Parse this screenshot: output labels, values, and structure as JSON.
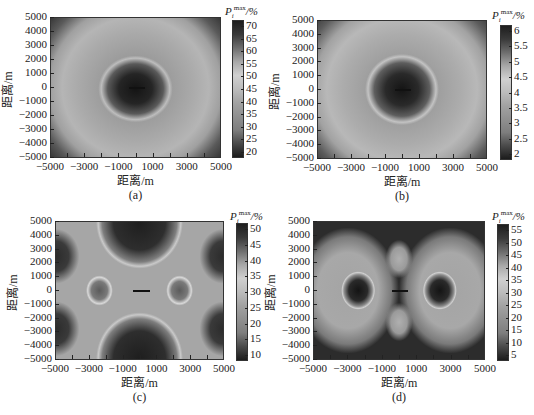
{
  "chart_data": [
    {
      "type": "heatmap",
      "panel": "(a)",
      "xlabel": "距离/m",
      "ylabel": "距离/m",
      "colorbar_title": "P_i^max/%",
      "xticks": [
        "−5000",
        "−3000",
        "−1000",
        "1000",
        "3000",
        "5000"
      ],
      "yticks": [
        "5000",
        "4000",
        "3000",
        "2000",
        "1000",
        "0",
        "−1000",
        "−2000",
        "−3000",
        "−4000",
        "−5000"
      ],
      "xlim": [
        -5000,
        5000
      ],
      "ylim": [
        -5000,
        5000
      ],
      "colorbar_ticks": [
        "70",
        "65",
        "60",
        "55",
        "50",
        "45",
        "40",
        "35",
        "30",
        "25",
        "20"
      ],
      "colorbar_range": [
        20,
        72
      ],
      "pattern": "dark central ellipse at origin (~20%), bright ring around it, mid-gray annulus to ~4500 m, dark corners",
      "grid": false
    },
    {
      "type": "heatmap",
      "panel": "(b)",
      "xlabel": "距离/m",
      "ylabel": "距离/m",
      "colorbar_title": "P_i^max/%",
      "xticks": [
        "−5000",
        "−3000",
        "−1000",
        "1000",
        "3000",
        "5000"
      ],
      "yticks": [
        "5000",
        "4000",
        "3000",
        "2000",
        "1000",
        "0",
        "−1000",
        "−2000",
        "−3000",
        "−4000",
        "−5000"
      ],
      "xlim": [
        -5000,
        5000
      ],
      "ylim": [
        -5000,
        5000
      ],
      "colorbar_ticks": [
        "6",
        "5.5",
        "5",
        "4.5",
        "4",
        "3.5",
        "3",
        "2.5",
        "2"
      ],
      "colorbar_range": [
        1.8,
        6.1
      ],
      "pattern": "dark central ellipse at origin, bright ring, mid-gray annulus, dark corners",
      "grid": false
    },
    {
      "type": "heatmap",
      "panel": "(c)",
      "xlabel": "距离/m",
      "ylabel": "距离/m",
      "colorbar_title": "P_i^max/%",
      "xticks": [
        "−5000",
        "−3000",
        "−1000",
        "1000",
        "3000",
        "5000"
      ],
      "yticks": [
        "5000",
        "4000",
        "3000",
        "2000",
        "1000",
        "0",
        "−1000",
        "−2000",
        "−3000",
        "−4000",
        "−5000"
      ],
      "xlim": [
        -5000,
        5000
      ],
      "ylim": [
        -5000,
        5000
      ],
      "colorbar_ticks": [
        "50",
        "45",
        "40",
        "35",
        "30",
        "25",
        "20",
        "15",
        "10"
      ],
      "colorbar_range": [
        9,
        54
      ],
      "pattern": "X-shaped bright band; dark lobes at top/bottom centre and at four side edges; two small dark circles at (±2500, 0); source arrow at origin",
      "grid": false
    },
    {
      "type": "heatmap",
      "panel": "(d)",
      "xlabel": "距离/m",
      "ylabel": "距离/m",
      "colorbar_title": "P_i^max/%",
      "xticks": [
        "−5000",
        "−3000",
        "−1000",
        "1000",
        "3000",
        "5000"
      ],
      "yticks": [
        "5000",
        "4000",
        "3000",
        "2000",
        "1000",
        "0",
        "−1000",
        "−2000",
        "−3000",
        "−4000",
        "−5000"
      ],
      "xlim": [
        -5000,
        5000
      ],
      "ylim": [
        -5000,
        5000
      ],
      "colorbar_ticks": [
        "55",
        "50",
        "45",
        "40",
        "35",
        "30",
        "25",
        "20",
        "15",
        "10",
        "5"
      ],
      "colorbar_range": [
        4,
        56
      ],
      "pattern": "dark background; two large bright lobes left/right with dark cores at (±2500, 0); two small bright lobes above/below origin at (0, ±2500); source line at origin",
      "grid": false
    }
  ],
  "labels": {
    "xlabel": "距离/m",
    "ylabel": "距离/m",
    "cb_P": "P",
    "cb_sup": "max",
    "cb_sub": "i",
    "cb_unit": "/%",
    "sub_a": "(a)",
    "sub_b": "(b)",
    "sub_c": "(c)",
    "sub_d": "(d)"
  },
  "xticks": [
    "−5000",
    "−3000",
    "−1000",
    "1000",
    "3000",
    "5000"
  ],
  "yticks": [
    "5000",
    "4000",
    "3000",
    "2000",
    "1000",
    "0",
    "−1000",
    "−2000",
    "−3000",
    "−4000",
    "−5000"
  ],
  "cbar_a": [
    "70",
    "65",
    "60",
    "55",
    "50",
    "45",
    "40",
    "35",
    "30",
    "25",
    "20"
  ],
  "cbar_b": [
    "6",
    "5.5",
    "5",
    "4.5",
    "4",
    "3.5",
    "3",
    "2.5",
    "2"
  ],
  "cbar_c": [
    "50",
    "45",
    "40",
    "35",
    "30",
    "25",
    "20",
    "15",
    "10"
  ],
  "cbar_d": [
    "55",
    "50",
    "45",
    "40",
    "35",
    "30",
    "25",
    "20",
    "15",
    "10",
    "5"
  ]
}
